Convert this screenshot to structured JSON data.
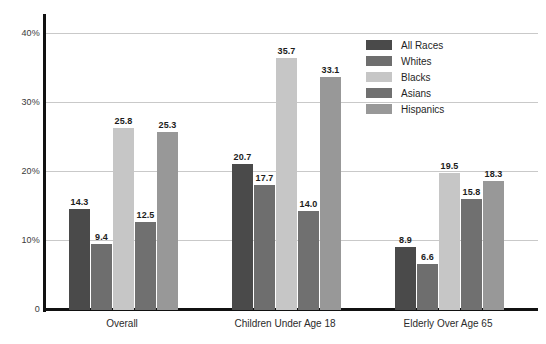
{
  "chart_data": {
    "type": "bar",
    "title": "",
    "subtitle": "",
    "xlabel": "",
    "ylabel": "",
    "categories": [
      "Overall",
      "Children Under Age 18",
      "Elderly Over Age 65"
    ],
    "series": [
      {
        "name": "All Races",
        "values": [
          14.3,
          20.7,
          8.9
        ],
        "color": "#4a4a4a"
      },
      {
        "name": "Whites",
        "values": [
          9.4,
          17.7,
          6.6
        ],
        "color": "#6e6e6e"
      },
      {
        "name": "Blacks",
        "values": [
          25.8,
          35.7,
          19.5
        ],
        "color": "#c6c6c6"
      },
      {
        "name": "Asians",
        "values": [
          12.5,
          14.0,
          15.8
        ],
        "color": "#707070"
      },
      {
        "name": "Hispanics",
        "values": [
          25.3,
          33.1,
          18.3
        ],
        "color": "#989898"
      }
    ],
    "ylim": [
      0,
      42
    ],
    "yticks": [
      0,
      10,
      20,
      30,
      40
    ],
    "ytick_labels": [
      "0",
      "10%",
      "20%",
      "30%",
      "40%"
    ],
    "grid": "horizontal",
    "legend_position": "top-right",
    "value_labels": true
  },
  "legend": {
    "items": [
      {
        "label": "All Races"
      },
      {
        "label": "Whites"
      },
      {
        "label": "Blacks"
      },
      {
        "label": "Asians"
      },
      {
        "label": "Hispanics"
      }
    ]
  },
  "colors": {
    "background": "#ffffff",
    "axis": "#111111",
    "gridline": "#c9c9c9",
    "tick_text": "#3a3a3a",
    "value_text": "#1c1c1c"
  }
}
